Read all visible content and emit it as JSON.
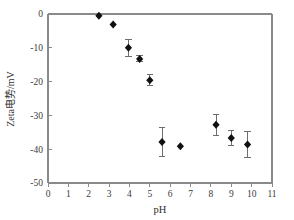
{
  "chart_data": {
    "type": "scatter",
    "title": "",
    "xlabel": "pH",
    "ylabel": "Zeta电势/mV",
    "xlim": [
      0,
      11
    ],
    "ylim": [
      -50,
      0
    ],
    "grid": false,
    "legend": "none",
    "xticks": [
      "0",
      "1",
      "2",
      "3",
      "4",
      "5",
      "6",
      "7",
      "8",
      "9",
      "10",
      "11"
    ],
    "yticks": [
      "0",
      "-10",
      "-20",
      "-30",
      "-40",
      "-50"
    ],
    "xtick_values": [
      0,
      1,
      2,
      3,
      4,
      5,
      6,
      7,
      8,
      9,
      10,
      11
    ],
    "ytick_values": [
      0,
      -10,
      -20,
      -30,
      -40,
      -50
    ],
    "marker_style": "filled-diamond",
    "marker_color": "#111111",
    "errorbar_color": "#6d6d6d",
    "axis_color": "#8a8a8a",
    "series": [
      {
        "name": "Zeta potential",
        "x": [
          2.5,
          3.2,
          3.95,
          4.5,
          5.0,
          5.6,
          6.5,
          8.25,
          9.0,
          9.8
        ],
        "y": [
          -0.5,
          -3.1,
          -10.0,
          -13.3,
          -19.6,
          -37.9,
          -39.1,
          -32.8,
          -36.7,
          -38.6
        ],
        "yerr": [
          0.0,
          0.0,
          2.6,
          0.9,
          1.6,
          4.3,
          0.0,
          3.0,
          2.3,
          3.8
        ]
      }
    ]
  }
}
